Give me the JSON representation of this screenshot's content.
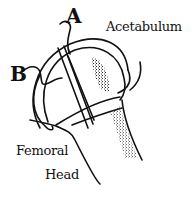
{
  "diagram": {
    "type": "anatomical line drawing",
    "labels": {
      "a": "A",
      "b": "B",
      "acetabulum": "Acetabulum",
      "femoral_line1": "Femoral",
      "femoral_line2": "Head"
    },
    "colors": {
      "ink": "#111111",
      "background": "#ffffff"
    }
  }
}
